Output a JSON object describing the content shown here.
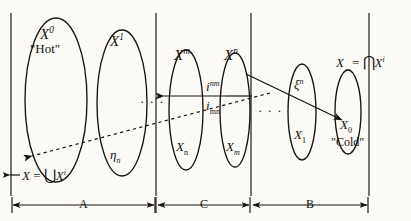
{
  "figure": {
    "kind": "mathematical-diagram",
    "background_color": "#fbfaf7",
    "ink_color": "#15130f"
  },
  "sets": [
    {
      "id": "X0",
      "label_base": "X",
      "label_sup": "0",
      "caption": "\"Hot\""
    },
    {
      "id": "X1sup",
      "label_base": "X",
      "label_sup": "1",
      "caption": ""
    },
    {
      "id": "Xm",
      "label_base": "X",
      "label_sup": "m",
      "caption": ""
    },
    {
      "id": "Xn",
      "label_base": "X",
      "label_sup": "n",
      "caption": ""
    },
    {
      "id": "xin",
      "label_base": "ξ",
      "label_sup": "n",
      "caption": ""
    },
    {
      "id": "Xinf",
      "label_base": "X",
      "label_sup": "",
      "caption": ""
    },
    {
      "id": "Xnsub",
      "label_base": "X",
      "label_sub": "n",
      "caption": ""
    },
    {
      "id": "Xmsub",
      "label_base": "X",
      "label_sub": "m",
      "caption": ""
    },
    {
      "id": "X1sub",
      "label_base": "X",
      "label_sub": "1",
      "caption": ""
    },
    {
      "id": "X0sub",
      "label_base": "X",
      "label_sub": "0",
      "caption": "\"Cold\""
    }
  ],
  "labels": {
    "x0_base": "X",
    "x0_sup": "0",
    "hot": "\"Hot\"",
    "x1_base": "X",
    "x1_sup": "1",
    "xm_base": "X",
    "xm_sup": "m",
    "xn_base": "X",
    "xn_sup": "n",
    "xi_base": "ξ",
    "xi_sup": "n",
    "xn_sub_base": "X",
    "xn_sub": "n",
    "xm_sub_base": "X",
    "xm_sub": "m",
    "x1_sub_base": "X",
    "x1_sub": "1",
    "x0_sub_base": "X",
    "x0_sub": "0",
    "cold": "\"Cold\"",
    "eta_base": "η",
    "eta_sub": "n",
    "i_upper_base": "i",
    "i_upper_sup": "nm",
    "i_lower_base": "i",
    "i_lower_sub": "mn",
    "ellipsis_left": "· · ·",
    "ellipsis_right": "· · ·"
  },
  "formulas": {
    "inverse_limit": {
      "base": "X",
      "subscript": "←",
      "equals": "=",
      "operator": "⋂",
      "term_base": "X",
      "term_sup": "i",
      "full_text": "X← = ⋂ Xⁱ"
    },
    "union": {
      "base": "X",
      "equals": "=",
      "operator": "⋃",
      "term_base": "X",
      "term_sup": "i",
      "full_text": "X = ⋃ Xⁱ"
    }
  },
  "brackets": [
    {
      "id": "A",
      "label": "A"
    },
    {
      "id": "C",
      "label": "C"
    },
    {
      "id": "B",
      "label": "B"
    }
  ]
}
